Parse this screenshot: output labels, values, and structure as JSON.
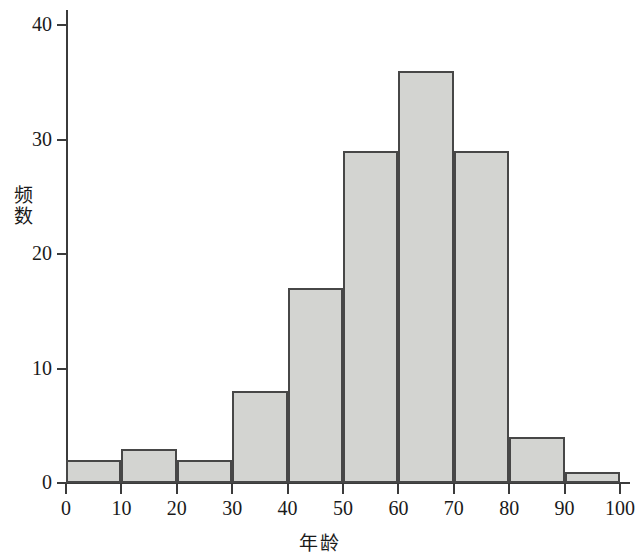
{
  "chart_data": {
    "type": "bar",
    "title": "",
    "subtitle": "",
    "xlabel": "年龄",
    "ylabel": "频数",
    "categories": [
      "0-10",
      "10-20",
      "20-30",
      "30-40",
      "40-50",
      "50-60",
      "60-70",
      "70-80",
      "80-90",
      "90-100"
    ],
    "bin_edges": [
      0,
      10,
      20,
      30,
      40,
      50,
      60,
      70,
      80,
      90,
      100
    ],
    "values": [
      2,
      3,
      2,
      8,
      17,
      29,
      36,
      29,
      4,
      1
    ],
    "xlim": [
      0,
      100
    ],
    "ylim": [
      0,
      40
    ],
    "xticks": [
      0,
      10,
      20,
      30,
      40,
      50,
      60,
      70,
      80,
      90,
      100
    ],
    "yticks": [
      0,
      10,
      20,
      30,
      40
    ],
    "xtick_labels": [
      "0",
      "10",
      "20",
      "30",
      "40",
      "50",
      "60",
      "70",
      "80",
      "90",
      "100"
    ],
    "ytick_labels": [
      "0",
      "10",
      "20",
      "30",
      "40"
    ],
    "grid": false,
    "legend": null,
    "annotations": [],
    "colors": {
      "bar_fill": "#d3d4d1",
      "bar_edge": "#474747",
      "axis": "#3b3b3b",
      "text": "#1a1a1a",
      "background": "#ffffff"
    }
  }
}
